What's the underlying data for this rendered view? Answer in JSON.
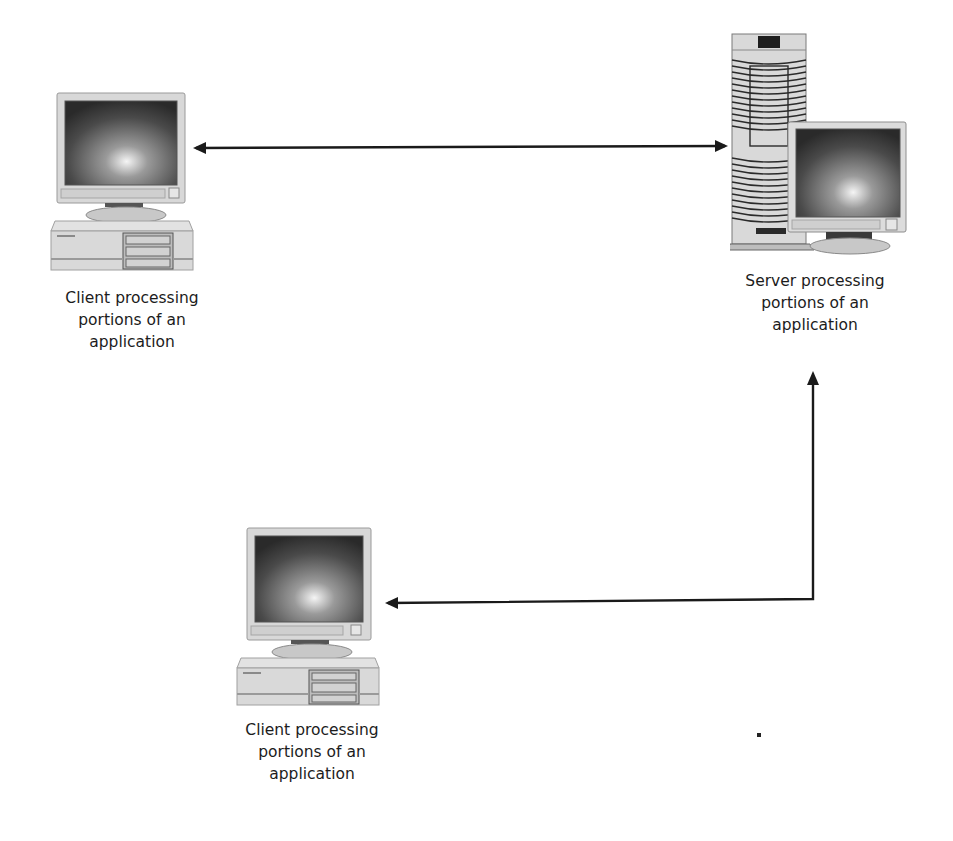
{
  "diagram": {
    "type": "client-server architecture",
    "nodes": [
      {
        "id": "client-1",
        "kind": "client-desktop-pc",
        "icon": "desktop-computer-icon",
        "label_lines": [
          "Client  processing",
          "portions of an",
          "application"
        ]
      },
      {
        "id": "server",
        "kind": "server-tower-with-monitor",
        "icon": "server-tower-icon",
        "label_lines": [
          "Server processing",
          "portions of an",
          "application"
        ]
      },
      {
        "id": "client-2",
        "kind": "client-desktop-pc",
        "icon": "desktop-computer-icon",
        "label_lines": [
          "Client  processing",
          "portions of an",
          "application"
        ]
      }
    ],
    "edges": [
      {
        "from": "client-1",
        "to": "server",
        "style": "bidirectional-arrow",
        "route": "horizontal"
      },
      {
        "from": "server",
        "to": "client-2",
        "style": "bidirectional-arrow",
        "route": "elbow (down then left)"
      }
    ],
    "colors": {
      "line": "#1a1a1a",
      "screen_dark": "#2b2b2b",
      "screen_glow": "#f2f2f2",
      "case_light": "#d9d9d9",
      "case_mid": "#bdbdbd",
      "background": "#ffffff"
    }
  }
}
